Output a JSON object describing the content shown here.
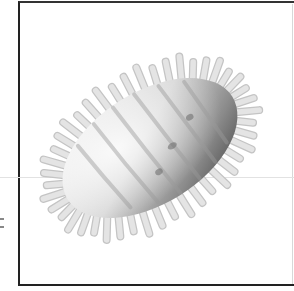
{
  "image": {
    "subject": "spiky oval microorganism illustration",
    "style": "grayscale shaded drawing",
    "colors": {
      "background": "#ffffff",
      "frame": "#222222",
      "body_light": "#f2f2f2",
      "body_mid": "#b5b5b5",
      "body_dark": "#4a4a4a",
      "spine": "#e4e4e4",
      "spine_stroke": "#c4c4c4"
    },
    "body": {
      "cx": 150,
      "cy": 148,
      "rx": 97,
      "ry": 56,
      "rotation": -32
    },
    "spine_count": 44
  }
}
